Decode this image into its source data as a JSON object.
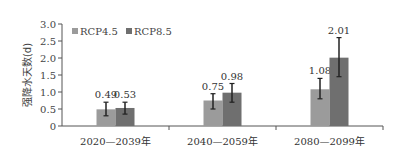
{
  "chart_data": {
    "type": "bar",
    "title": "",
    "xlabel": "",
    "ylabel": "强降水天数(d)",
    "ylim": [
      0,
      3.0
    ],
    "yticks": [
      "0",
      "0.5",
      "1.0",
      "1.5",
      "2.0",
      "2.5",
      "3.0"
    ],
    "categories": [
      "2020—2039年",
      "2040—2059年",
      "2080—2099年"
    ],
    "series": [
      {
        "name": "RCP4.5",
        "color": "#9b9b9b",
        "values": [
          0.49,
          0.75,
          1.08
        ],
        "labels": [
          "0.49",
          "0.75",
          "1.08"
        ],
        "error_low": [
          0.3,
          0.5,
          0.8
        ],
        "error_high": [
          0.7,
          0.95,
          1.4
        ]
      },
      {
        "name": "RCP8.5",
        "color": "#6f6f6f",
        "values": [
          0.53,
          0.98,
          2.01
        ],
        "labels": [
          "0.53",
          "0.98",
          "2.01"
        ],
        "error_low": [
          0.35,
          0.7,
          1.45
        ],
        "error_high": [
          0.7,
          1.25,
          2.6
        ]
      }
    ],
    "legend": {
      "position": "top-left",
      "entries": [
        "RCP4.5",
        "RCP8.5"
      ]
    },
    "grid": false,
    "error_bars": true
  }
}
